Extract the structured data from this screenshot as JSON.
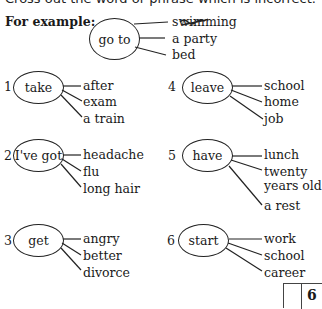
{
  "instruction": "Cross out the word or phrase which is incorrect.",
  "example": {
    "label": "For example:",
    "verb": "go to",
    "options": [
      "swimming",
      "a party",
      "bed"
    ],
    "crossed_out_index": 0
  },
  "items": [
    {
      "number": "1",
      "verb": "take",
      "options": [
        "after",
        "exam",
        "a train"
      ]
    },
    {
      "number": "2",
      "verb": "I've got",
      "options": [
        "headache",
        "flu",
        "long hair"
      ]
    },
    {
      "number": "3",
      "verb": "get",
      "options": [
        "angry",
        "better",
        "divorce"
      ]
    },
    {
      "number": "4",
      "verb": "leave",
      "options": [
        "school",
        "home",
        "job"
      ]
    },
    {
      "number": "5",
      "verb": "have",
      "options": [
        "lunch",
        "twenty",
        "years old",
        "a rest"
      ]
    },
    {
      "number": "6",
      "verb": "start",
      "options": [
        "work",
        "school",
        "career"
      ]
    }
  ],
  "score": {
    "total": "6",
    "answer": ""
  }
}
